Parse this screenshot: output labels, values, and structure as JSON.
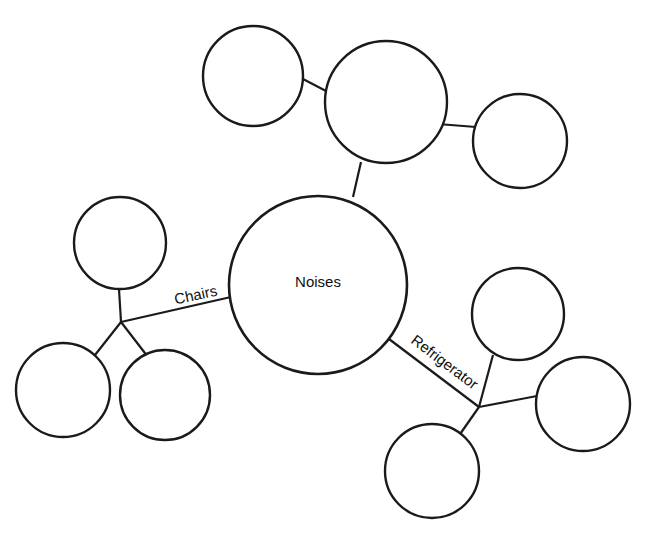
{
  "diagram": {
    "type": "mind-map",
    "background_color": "#ffffff",
    "stroke_color": "#1a1a1a",
    "text_color": "#111111",
    "root": {
      "label": "Noises",
      "cx": 318,
      "cy": 285,
      "r": 89
    },
    "nodes": [
      {
        "id": "hub-top",
        "label": "",
        "cx": 386,
        "cy": 102,
        "r": 61
      },
      {
        "id": "top-left-leaf",
        "label": "",
        "cx": 253,
        "cy": 76,
        "r": 50
      },
      {
        "id": "top-right-leaf",
        "label": "",
        "cx": 520,
        "cy": 141,
        "r": 47
      },
      {
        "id": "left-upper-leaf",
        "label": "",
        "cx": 120,
        "cy": 243,
        "r": 46
      },
      {
        "id": "left-lower-leaf",
        "label": "",
        "cx": 63,
        "cy": 390,
        "r": 47
      },
      {
        "id": "left-bottom-leaf",
        "label": "",
        "cx": 165,
        "cy": 395,
        "r": 45
      },
      {
        "id": "right-upper-leaf",
        "label": "",
        "cx": 518,
        "cy": 314,
        "r": 46
      },
      {
        "id": "right-middle-leaf",
        "label": "",
        "cx": 583,
        "cy": 404,
        "r": 47
      },
      {
        "id": "right-lower-leaf",
        "label": "",
        "cx": 432,
        "cy": 471,
        "r": 47
      }
    ],
    "junctions": [
      {
        "id": "left-junction",
        "x": 121,
        "y": 322
      },
      {
        "id": "right-junction",
        "x": 479,
        "y": 407
      }
    ],
    "edges": [
      {
        "id": "root-to-hub-top",
        "x1": 353,
        "y1": 197,
        "x2": 361,
        "y2": 162
      },
      {
        "id": "hub-top-to-top-left",
        "x1": 326,
        "y1": 91,
        "x2": 303,
        "y2": 79
      },
      {
        "id": "hub-top-to-top-right",
        "x1": 438,
        "y1": 124,
        "x2": 476,
        "y2": 127
      },
      {
        "id": "root-to-left-junction",
        "x1": 231,
        "y1": 297,
        "x2": 121,
        "y2": 322
      },
      {
        "id": "left-junction-to-upper",
        "x1": 121,
        "y1": 322,
        "x2": 119,
        "y2": 289
      },
      {
        "id": "left-junction-to-lower",
        "x1": 121,
        "y1": 322,
        "x2": 95,
        "y2": 355
      },
      {
        "id": "left-junction-to-bottom",
        "x1": 121,
        "y1": 322,
        "x2": 148,
        "y2": 357
      },
      {
        "id": "root-to-right-junction",
        "x1": 389,
        "y1": 339,
        "x2": 479,
        "y2": 407
      },
      {
        "id": "right-junction-to-upper",
        "x1": 479,
        "y1": 407,
        "x2": 493,
        "y2": 355
      },
      {
        "id": "right-junction-to-middle",
        "x1": 479,
        "y1": 407,
        "x2": 537,
        "y2": 396
      },
      {
        "id": "right-junction-to-lower",
        "x1": 479,
        "y1": 407,
        "x2": 458,
        "y2": 437
      }
    ],
    "edge_labels": [
      {
        "id": "chairs-label",
        "text": "Chairs",
        "x": 196,
        "y": 296,
        "rotation": -12
      },
      {
        "id": "refrigerator-label",
        "text": "Refrigerator",
        "x": 444,
        "y": 363,
        "rotation": 37
      }
    ]
  }
}
